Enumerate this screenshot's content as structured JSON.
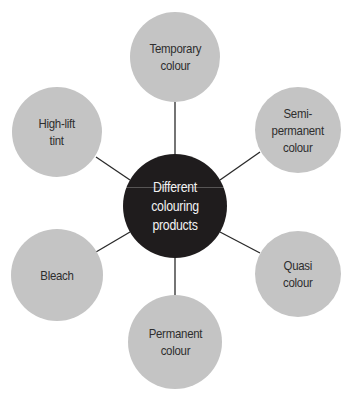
{
  "diagram": {
    "type": "hub-and-spoke",
    "colors": {
      "hub_fill": "#1f1c1d",
      "hub_text": "#f2f2f2",
      "node_fill": "#c4c4c4",
      "node_text": "#2e2e2e",
      "connector": "#2a2a2a"
    },
    "hub": {
      "label": "Different\ncolouring products",
      "cx": 175,
      "cy": 206,
      "r": 52
    },
    "nodes": [
      {
        "id": "temporary",
        "label": "Temporary\ncolour",
        "cx": 175,
        "cy": 57,
        "r": 45
      },
      {
        "id": "semi-permanent",
        "label": "Semi-\npermanent\ncolour",
        "cx": 298,
        "cy": 130,
        "r": 43
      },
      {
        "id": "quasi",
        "label": "Quasi\ncolour",
        "cx": 298,
        "cy": 274,
        "r": 43
      },
      {
        "id": "permanent",
        "label": "Permanent\ncolour",
        "cx": 175,
        "cy": 342,
        "r": 47
      },
      {
        "id": "bleach",
        "label": "Bleach",
        "cx": 57,
        "cy": 275,
        "r": 46
      },
      {
        "id": "high-lift",
        "label": "High-lift\ntint",
        "cx": 57,
        "cy": 132,
        "r": 45
      }
    ]
  }
}
